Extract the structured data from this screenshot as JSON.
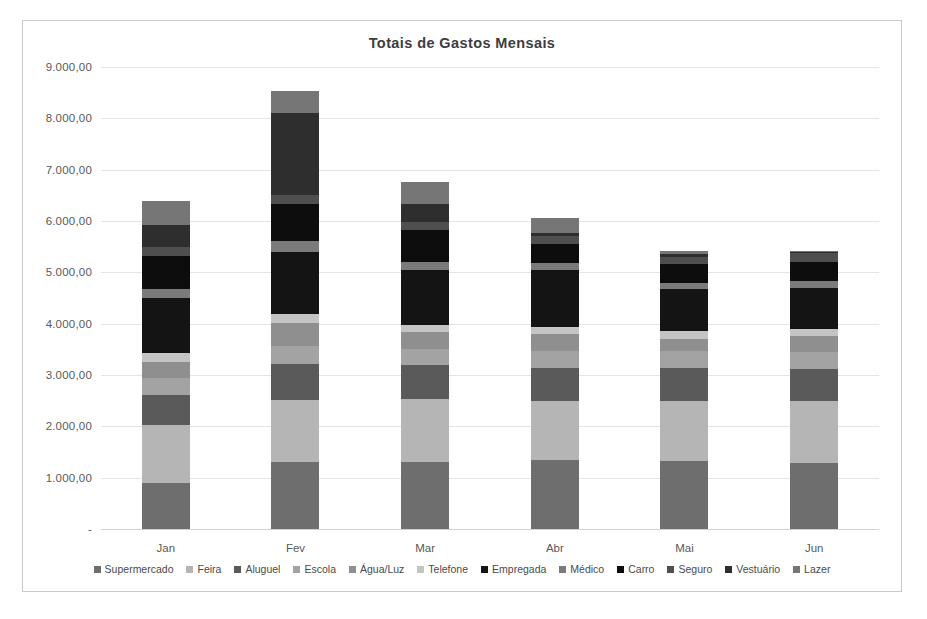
{
  "chart_data": {
    "type": "bar",
    "subtype": "stacked-column",
    "title": "Totais de Gastos Mensais",
    "xlabel": "",
    "ylabel": "",
    "ylim": [
      0,
      9000
    ],
    "grid": true,
    "legend_position": "bottom",
    "categories": [
      "Jan",
      "Fev",
      "Mar",
      "Abr",
      "Mai",
      "Jun"
    ],
    "ytick_labels": [
      "9.000,00",
      "8.000,00",
      "7.000,00",
      "6.000,00",
      "5.000,00",
      "4.000,00",
      "3.000,00",
      "2.000,00",
      "1.000,00",
      "-"
    ],
    "ytick_values": [
      9000,
      8000,
      7000,
      6000,
      5000,
      4000,
      3000,
      2000,
      1000,
      0
    ],
    "series": [
      {
        "name": "Supermercado",
        "color": "#6e6e6e",
        "values": [
          900,
          1300,
          1300,
          1340,
          1330,
          1280
        ]
      },
      {
        "name": "Feira",
        "color": "#b5b5b5",
        "values": [
          1120,
          1220,
          1230,
          1160,
          1170,
          1210
        ]
      },
      {
        "name": "Aluguel",
        "color": "#5a5a5a",
        "values": [
          600,
          700,
          660,
          640,
          640,
          630
        ]
      },
      {
        "name": "Escola",
        "color": "#a3a3a3",
        "values": [
          330,
          340,
          320,
          330,
          320,
          320
        ]
      },
      {
        "name": "Água/Luz",
        "color": "#8f8f8f",
        "values": [
          310,
          450,
          320,
          330,
          240,
          320
        ]
      },
      {
        "name": "Telefone",
        "color": "#c4c4c4",
        "values": [
          160,
          180,
          150,
          140,
          150,
          140
        ]
      },
      {
        "name": "Empregada",
        "color": "#141414",
        "values": [
          1090,
          1210,
          1070,
          1110,
          820,
          790
        ]
      },
      {
        "name": "Médico",
        "color": "#7b7b7b",
        "values": [
          170,
          210,
          150,
          140,
          130,
          150
        ]
      },
      {
        "name": "Carro",
        "color": "#0d0d0d",
        "values": [
          640,
          730,
          620,
          370,
          360,
          370
        ]
      },
      {
        "name": "Seguro",
        "color": "#4f4f4f",
        "values": [
          170,
          160,
          160,
          150,
          150,
          160
        ]
      },
      {
        "name": "Vestuário",
        "color": "#2e2e2e",
        "values": [
          440,
          1600,
          360,
          60,
          50,
          30
        ]
      },
      {
        "name": "Lazer",
        "color": "#767676",
        "values": [
          470,
          430,
          430,
          290,
          50,
          10
        ]
      }
    ],
    "totals": [
      6400,
      8530,
      6190,
      5830,
      5420,
      5410
    ]
  }
}
